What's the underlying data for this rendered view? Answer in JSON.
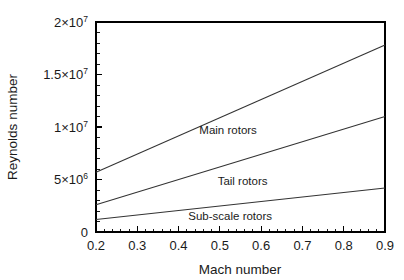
{
  "chart_data": {
    "type": "line",
    "title": "",
    "xlabel": "Mach number",
    "ylabel": "Reynolds number",
    "xlim": [
      0.2,
      0.9
    ],
    "ylim": [
      0,
      20000000
    ],
    "grid": false,
    "legend_position": "inline-annotations",
    "x_major_ticks": [
      0.2,
      0.3,
      0.4,
      0.5,
      0.6,
      0.7,
      0.8,
      0.9
    ],
    "x_tick_labels": [
      "0.2",
      "0.3",
      "0.4",
      "0.5",
      "0.6",
      "0.7",
      "0.8",
      "0.9"
    ],
    "x_minor_tick_step": 0.02,
    "y_major_ticks": [
      0,
      5000000,
      10000000,
      15000000,
      20000000
    ],
    "y_tick_labels": [
      {
        "mantissa": "0",
        "times": "",
        "base": "",
        "exponent": ""
      },
      {
        "mantissa": "5",
        "times": "×",
        "base": "10",
        "exponent": "6"
      },
      {
        "mantissa": "1",
        "times": "×",
        "base": "10",
        "exponent": "7"
      },
      {
        "mantissa": "1.5",
        "times": "×",
        "base": "10",
        "exponent": "7"
      },
      {
        "mantissa": "2",
        "times": "×",
        "base": "10",
        "exponent": "7"
      }
    ],
    "y_minor_tick_step": 1000000,
    "x": [
      0.2,
      0.9
    ],
    "series": [
      {
        "name": "Main rotors",
        "values": [
          5700000,
          17800000
        ],
        "label_x": 0.52,
        "label_y": 9300000
      },
      {
        "name": "Tail rotors",
        "values": [
          2600000,
          11000000
        ],
        "label_x": 0.555,
        "label_y": 4500000
      },
      {
        "name": "Sub-scale rotors",
        "values": [
          1200000,
          4200000
        ],
        "label_x": 0.525,
        "label_y": 1150000
      }
    ]
  },
  "style": {
    "axis_color": "#000000",
    "line_color": "#333333",
    "text_color": "#1a1a1a",
    "background": "#ffffff"
  }
}
